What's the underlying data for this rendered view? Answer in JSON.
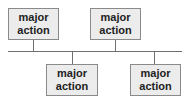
{
  "diagram": {
    "type": "timeline",
    "nodes": [
      {
        "line1": "major",
        "line2": "action",
        "position": "above"
      },
      {
        "line1": "major",
        "line2": "action",
        "position": "above"
      },
      {
        "line1": "major",
        "line2": "action",
        "position": "below"
      },
      {
        "line1": "major",
        "line2": "action",
        "position": "below"
      }
    ]
  }
}
